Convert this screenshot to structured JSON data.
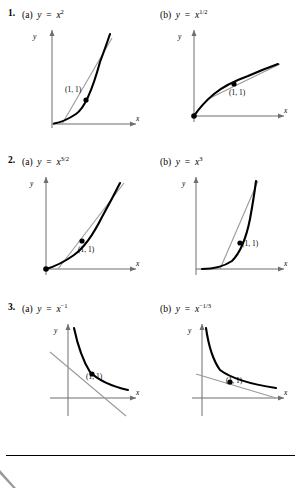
{
  "exercises": [
    {
      "number": "1.",
      "parts": [
        {
          "tag": "(a)",
          "lhs": "y",
          "eq": "=",
          "base": "x",
          "exp": "2"
        },
        {
          "tag": "(b)",
          "lhs": "y",
          "eq": "=",
          "base": "x",
          "exp": "1/2"
        }
      ]
    },
    {
      "number": "2.",
      "parts": [
        {
          "tag": "(a)",
          "lhs": "y",
          "eq": "=",
          "base": "x",
          "exp": "3/2"
        },
        {
          "tag": "(b)",
          "lhs": "y",
          "eq": "=",
          "base": "x",
          "exp": "3"
        }
      ]
    },
    {
      "number": "3.",
      "parts": [
        {
          "tag": "(a)",
          "lhs": "y",
          "eq": "=",
          "base": "x",
          "exp": "−1"
        },
        {
          "tag": "(b)",
          "lhs": "y",
          "eq": "=",
          "base": "x",
          "exp": "−1/3"
        }
      ]
    }
  ],
  "axes": {
    "x_label": "x",
    "y_label": "y"
  },
  "point_label": "(1, 1)",
  "colors": {
    "curve": "#000000",
    "tangent": "#9a9a9a",
    "axis": "#6f6f6f",
    "point": "#000000",
    "page_background": "#ffffff"
  },
  "graphs": [
    {
      "id": "graph-1a",
      "function": "y = x^2",
      "point": [
        1,
        1
      ],
      "tangent_slope": 2
    },
    {
      "id": "graph-1b",
      "function": "y = x^(1/2)",
      "point": [
        1,
        1
      ],
      "tangent_slope": 0.5
    },
    {
      "id": "graph-2a",
      "function": "y = x^(3/2)",
      "point": [
        1,
        1
      ],
      "tangent_slope": 1.5
    },
    {
      "id": "graph-2b",
      "function": "y = x^3",
      "point": [
        1,
        1
      ],
      "tangent_slope": 3
    },
    {
      "id": "graph-3a",
      "function": "y = x^(-1)",
      "point": [
        1,
        1
      ],
      "tangent_slope": -1
    },
    {
      "id": "graph-3b",
      "function": "y = x^(-1/3)",
      "point": [
        1,
        1
      ],
      "tangent_slope": -0.3333
    }
  ]
}
